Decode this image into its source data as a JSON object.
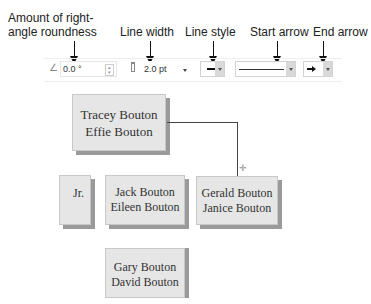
{
  "callouts": {
    "roundness": [
      "Amount of right-",
      "angle roundness"
    ],
    "line_width": "Line width",
    "line_style": "Line style",
    "start_arrow": "Start arrow",
    "end_arrow": "End arrow"
  },
  "toolbar": {
    "roundness_value": "0.0 °",
    "line_width_value": "2.0 pt",
    "line_style_glyph": "—",
    "end_arrow_glyph": "➔"
  },
  "chart": {
    "boxes": [
      {
        "id": "tracey-effie",
        "lines": [
          "Tracey Bouton",
          "Effie Bouton"
        ]
      },
      {
        "id": "jr",
        "lines": [
          "Jr."
        ]
      },
      {
        "id": "jack-eileen",
        "lines": [
          "Jack Bouton",
          "Eileen Bouton"
        ]
      },
      {
        "id": "gerald-janice",
        "lines": [
          "Gerald Bouton",
          "Janice Bouton"
        ]
      },
      {
        "id": "gary-david",
        "lines": [
          "Gary Bouton",
          "David Bouton"
        ]
      }
    ]
  }
}
